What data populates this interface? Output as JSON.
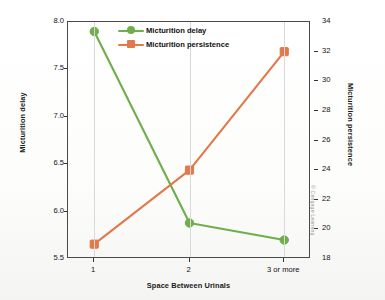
{
  "chart_data": {
    "type": "line",
    "title": "",
    "xlabel": "Space Between Urinals",
    "ylabel": "Micturition delay",
    "y2label": "Micturition persistence",
    "categories": [
      "1",
      "2",
      "3 or more"
    ],
    "grid": "vertical",
    "legend_position": "top-center",
    "axes": {
      "left": {
        "label": "Micturition delay",
        "min": 5.5,
        "max": 8.0,
        "tick_step": 0.5,
        "ticks": [
          "8.0",
          "7.5",
          "7.0",
          "6.5",
          "6.0",
          "5.5"
        ],
        "tick_values": [
          8.0,
          7.5,
          7.0,
          6.5,
          6.0,
          5.5
        ]
      },
      "right": {
        "label": "Micturition persistence",
        "min": 18,
        "max": 34,
        "tick_step": 2,
        "ticks": [
          "34",
          "32",
          "30",
          "28",
          "26",
          "24",
          "22",
          "20",
          "18"
        ],
        "tick_values": [
          34,
          32,
          30,
          28,
          26,
          24,
          22,
          20,
          18
        ]
      },
      "x": {
        "label": "Space Between Urinals",
        "ticks": [
          "1",
          "2",
          "3 or more"
        ]
      }
    },
    "series": [
      {
        "name": "Micturition delay",
        "axis": "left",
        "color": "#6FAE4A",
        "marker": "circle",
        "values": [
          7.9,
          5.88,
          5.7
        ]
      },
      {
        "name": "Micturition persistence",
        "axis": "right",
        "color": "#E2794B",
        "marker": "square",
        "values": [
          19.0,
          24.0,
          32.0
        ]
      }
    ]
  },
  "legend": {
    "items": [
      {
        "label": "Micturition delay",
        "color": "#6FAE4A",
        "marker": "circle"
      },
      {
        "label": "Micturition persistence",
        "color": "#E2794B",
        "marker": "square"
      }
    ]
  },
  "credit": {
    "text": "© Cengage Learning"
  },
  "colors": {
    "series_green": "#6FAE4A",
    "series_orange": "#E2794B",
    "axis": "#4a4a4a",
    "grid": "#d9d9da",
    "text": "#111111",
    "credit_text": "#9a9a9a",
    "background": "#ffffff"
  }
}
